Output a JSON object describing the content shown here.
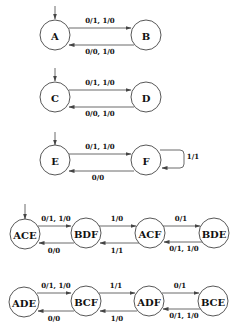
{
  "diagram": {
    "type": "finite-state-machines",
    "machines": [
      {
        "id": "machine-1",
        "states": [
          {
            "id": "A",
            "label": "A",
            "initial": true
          },
          {
            "id": "B",
            "label": "B",
            "initial": false
          }
        ],
        "transitions": [
          {
            "from": "A",
            "to": "B",
            "label": "0/1, 1/0"
          },
          {
            "from": "B",
            "to": "A",
            "label": "0/0, 1/0"
          }
        ]
      },
      {
        "id": "machine-2",
        "states": [
          {
            "id": "C",
            "label": "C",
            "initial": true
          },
          {
            "id": "D",
            "label": "D",
            "initial": false
          }
        ],
        "transitions": [
          {
            "from": "C",
            "to": "D",
            "label": "0/1, 1/0"
          },
          {
            "from": "D",
            "to": "C",
            "label": "0/0, 1/0"
          }
        ]
      },
      {
        "id": "machine-3",
        "states": [
          {
            "id": "E",
            "label": "E",
            "initial": true
          },
          {
            "id": "F",
            "label": "F",
            "initial": false
          }
        ],
        "transitions": [
          {
            "from": "E",
            "to": "F",
            "label": "0/1, 1/0"
          },
          {
            "from": "F",
            "to": "F",
            "label": "1/1"
          },
          {
            "from": "F",
            "to": "E",
            "label": "0/0"
          }
        ]
      },
      {
        "id": "machine-4",
        "states": [
          {
            "id": "ACE",
            "label": "ACE",
            "initial": true
          },
          {
            "id": "BDF",
            "label": "BDF",
            "initial": false
          },
          {
            "id": "ACF",
            "label": "ACF",
            "initial": false
          },
          {
            "id": "BDE",
            "label": "BDE",
            "initial": false
          }
        ],
        "transitions": [
          {
            "from": "ACE",
            "to": "BDF",
            "label": "0/1, 1/0"
          },
          {
            "from": "BDF",
            "to": "ACE",
            "label": "0/0"
          },
          {
            "from": "BDF",
            "to": "ACF",
            "label": "1/0"
          },
          {
            "from": "ACF",
            "to": "BDF",
            "label": "1/1"
          },
          {
            "from": "ACF",
            "to": "BDE",
            "label": "0/1"
          },
          {
            "from": "BDE",
            "to": "ACF",
            "label": "0/1, 1/0"
          }
        ]
      },
      {
        "id": "machine-5",
        "states": [
          {
            "id": "ADE",
            "label": "ADE",
            "initial": false
          },
          {
            "id": "BCF",
            "label": "BCF",
            "initial": false
          },
          {
            "id": "ADF",
            "label": "ADF",
            "initial": false
          },
          {
            "id": "BCE",
            "label": "BCE",
            "initial": false
          }
        ],
        "transitions": [
          {
            "from": "ADE",
            "to": "BCF",
            "label": "0/1, 1/0"
          },
          {
            "from": "BCF",
            "to": "ADE",
            "label": "0/0"
          },
          {
            "from": "BCF",
            "to": "ADF",
            "label": "1/1"
          },
          {
            "from": "ADF",
            "to": "BCF",
            "label": "1/0"
          },
          {
            "from": "ADF",
            "to": "BCE",
            "label": "0/1"
          },
          {
            "from": "BCE",
            "to": "ADF",
            "label": "0/1, 1/0"
          }
        ]
      }
    ]
  },
  "labels": {
    "m1": {
      "A": "A",
      "B": "B",
      "ab": "0/1, 1/0",
      "ba": "0/0, 1/0"
    },
    "m2": {
      "C": "C",
      "D": "D",
      "cd": "0/1, 1/0",
      "dc": "0/0, 1/0"
    },
    "m3": {
      "E": "E",
      "F": "F",
      "ef": "0/1, 1/0",
      "ff": "1/1",
      "fe": "0/0"
    },
    "m4": {
      "ACE": "ACE",
      "BDF": "BDF",
      "ACF": "ACF",
      "BDE": "BDE",
      "ace_bdf": "0/1, 1/0",
      "bdf_ace": "0/0",
      "bdf_acf": "1/0",
      "acf_bdf": "1/1",
      "acf_bde": "0/1",
      "bde_acf": "0/1, 1/0"
    },
    "m5": {
      "ADE": "ADE",
      "BCF": "BCF",
      "ADF": "ADF",
      "BCE": "BCE",
      "ade_bcf": "0/1, 1/0",
      "bcf_ade": "0/0",
      "bcf_adf": "1/1",
      "adf_bcf": "1/0",
      "adf_bce": "0/1",
      "bce_adf": "0/1, 1/0"
    }
  },
  "colors": {
    "stroke": "#444444",
    "text": "#111111",
    "background": "#ffffff"
  }
}
